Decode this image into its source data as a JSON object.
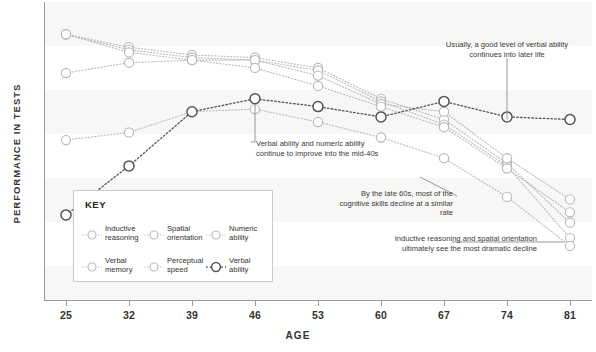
{
  "chart_data": {
    "type": "line",
    "title": "",
    "xlabel": "AGE",
    "ylabel": "PERFORMANCE IN TESTS",
    "x": [
      25,
      32,
      39,
      46,
      53,
      60,
      67,
      74,
      81
    ],
    "categories": [
      "25",
      "32",
      "39",
      "46",
      "53",
      "60",
      "67",
      "74",
      "81"
    ],
    "xlim": [
      25,
      81
    ],
    "ylim": [
      0,
      100
    ],
    "grid": false,
    "legend_position": "inside-lower-left",
    "legend_title": "KEY",
    "y_tick_labels": [],
    "series": [
      {
        "name": "Inductive reasoning",
        "color": "#b9b9b9",
        "line_style": "dotted",
        "values": [
          96,
          91,
          88,
          87,
          83,
          71,
          63,
          46,
          23
        ]
      },
      {
        "name": "Spatial orientation",
        "color": "#b9b9b9",
        "line_style": "dotted",
        "values": [
          96,
          90,
          87,
          86,
          82,
          70,
          61,
          45,
          17
        ]
      },
      {
        "name": "Numeric ability",
        "color": "#b9b9b9",
        "line_style": "dotted",
        "values": [
          81,
          85,
          86,
          86,
          80,
          69,
          66,
          48,
          32
        ]
      },
      {
        "name": "Verbal memory",
        "color": "#b9b9b9",
        "line_style": "dotted",
        "values": [
          96,
          89,
          86,
          83,
          76,
          68,
          60,
          44,
          27
        ]
      },
      {
        "name": "Perceptual speed",
        "color": "#b9b9b9",
        "line_style": "dotted",
        "values": [
          55,
          58,
          66,
          67,
          62,
          56,
          48,
          33,
          14
        ]
      },
      {
        "name": "Verbal ability",
        "color": "#555555",
        "line_style": "dotted",
        "values": [
          26,
          45,
          66,
          71,
          68,
          64,
          70,
          64,
          63
        ]
      }
    ],
    "annotations": [
      {
        "id": "verbal-later-life",
        "text": "Usually, a good level of verbal ability continues into later life",
        "target_series": "Verbal ability",
        "target_age": 81
      },
      {
        "id": "improve-mid-40s",
        "text": "Verbal ability and numeric ability continue to improve into the mid-40s",
        "target_series": "Verbal ability",
        "target_age": 46
      },
      {
        "id": "late-60s-decline",
        "text": "By the late 60s, most of the cognitive skills decline at a similar rate",
        "target_age": 67
      },
      {
        "id": "dramatic-decline",
        "text": "Inductive reasoning and spatial orientation ultimately see the most dramatic decline",
        "target_age": 81
      }
    ]
  },
  "legend": {
    "title": "KEY",
    "items": [
      {
        "label": "Inductive\nreasoning",
        "color": "#b9b9b9",
        "emphasis": false
      },
      {
        "label": "Spatial\norientation",
        "color": "#b9b9b9",
        "emphasis": false
      },
      {
        "label": "Numeric\nability",
        "color": "#b9b9b9",
        "emphasis": false
      },
      {
        "label": "Verbal\nmemory",
        "color": "#b9b9b9",
        "emphasis": false
      },
      {
        "label": "Perceptual\nspeed",
        "color": "#b9b9b9",
        "emphasis": false
      },
      {
        "label": "Verbal\nability",
        "color": "#555555",
        "emphasis": true
      }
    ]
  },
  "axes": {
    "x_title": "AGE",
    "y_title": "PERFORMANCE IN TESTS",
    "x_ticks": [
      "25",
      "32",
      "39",
      "46",
      "53",
      "60",
      "67",
      "74",
      "81"
    ]
  },
  "annotations": {
    "a1": "Usually, a good level of verbal ability continues into later life",
    "a2": "Verbal ability and numeric ability continue to improve into the mid-40s",
    "a3": "By the late 60s, most of the cognitive skills decline at a similar rate",
    "a4": "Inductive reasoning and spatial orientation ultimately see the most dramatic decline"
  },
  "colors": {
    "series_light": "#b9b9b9",
    "series_dark": "#555555",
    "band": "#f7f7f5",
    "axis": "#9a9a9a",
    "text": "#333333"
  }
}
